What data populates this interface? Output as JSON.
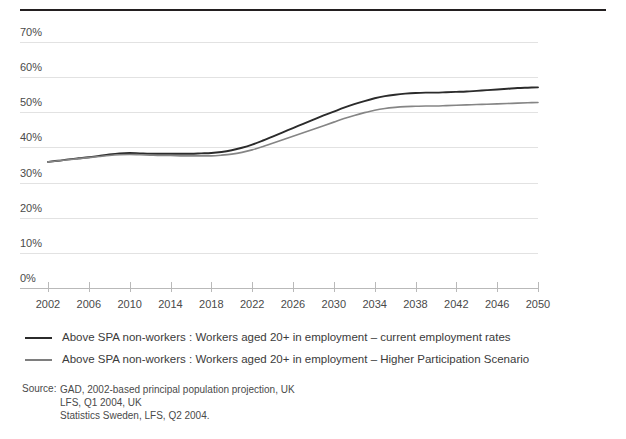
{
  "figure": {
    "title_partial": "",
    "rule_color": "#231f20"
  },
  "source": {
    "label": "Source:",
    "lines": [
      "GAD, 2002-based principal population projection, UK",
      "LFS, Q1 2004, UK",
      "Statistics Sweden, LFS, Q2 2004."
    ]
  },
  "chart_data": {
    "type": "line",
    "title": "",
    "subtitle": "",
    "xlabel": "",
    "ylabel": "",
    "xlim": [
      2002,
      2050
    ],
    "ylim": [
      0,
      70
    ],
    "grid": true,
    "legend_position": "below",
    "y_tick_labels": [
      "70%",
      "60%",
      "50%",
      "40%",
      "30%",
      "20%",
      "10%",
      "0%"
    ],
    "y_tick_values": [
      70,
      60,
      50,
      40,
      30,
      20,
      10,
      0
    ],
    "x_tick_labels": [
      "2002",
      "2006",
      "2010",
      "2014",
      "2018",
      "2022",
      "2026",
      "2030",
      "2034",
      "2038",
      "2042",
      "2046",
      "2050"
    ],
    "x_tick_values": [
      2002,
      2006,
      2010,
      2014,
      2018,
      2022,
      2026,
      2030,
      2034,
      2038,
      2042,
      2046,
      2050
    ],
    "x": [
      2002,
      2003,
      2004,
      2005,
      2006,
      2007,
      2008,
      2009,
      2010,
      2011,
      2012,
      2013,
      2014,
      2015,
      2016,
      2017,
      2018,
      2019,
      2020,
      2021,
      2022,
      2023,
      2024,
      2025,
      2026,
      2027,
      2028,
      2029,
      2030,
      2031,
      2032,
      2033,
      2034,
      2035,
      2036,
      2037,
      2038,
      2039,
      2040,
      2041,
      2042,
      2043,
      2044,
      2045,
      2046,
      2047,
      2048,
      2049,
      2050
    ],
    "series": [
      {
        "name": "Above SPA non-workers : Workers aged 20+ in employment – current employment rates",
        "color": "#2b2b2b",
        "width": 1.9,
        "values": [
          35.9,
          36.2,
          36.6,
          36.9,
          37.2,
          37.6,
          38.0,
          38.3,
          38.4,
          38.3,
          38.2,
          38.2,
          38.2,
          38.2,
          38.2,
          38.3,
          38.4,
          38.7,
          39.2,
          39.9,
          40.8,
          41.9,
          43.1,
          44.3,
          45.5,
          46.7,
          47.9,
          49.1,
          50.2,
          51.3,
          52.3,
          53.2,
          54.0,
          54.6,
          55.0,
          55.3,
          55.5,
          55.6,
          55.6,
          55.7,
          55.8,
          55.9,
          56.1,
          56.3,
          56.5,
          56.7,
          56.9,
          57.0,
          57.1
        ]
      },
      {
        "name": "Above SPA non-workers : Workers aged 20+ in employment – Higher Participation Scenario",
        "color": "#858585",
        "width": 1.6,
        "values": [
          35.9,
          36.2,
          36.5,
          36.8,
          37.1,
          37.4,
          37.7,
          37.9,
          38.0,
          37.9,
          37.8,
          37.7,
          37.7,
          37.6,
          37.6,
          37.6,
          37.6,
          37.8,
          38.1,
          38.6,
          39.3,
          40.2,
          41.2,
          42.2,
          43.2,
          44.2,
          45.2,
          46.2,
          47.2,
          48.2,
          49.1,
          49.9,
          50.6,
          51.1,
          51.4,
          51.6,
          51.7,
          51.8,
          51.8,
          51.9,
          52.0,
          52.1,
          52.2,
          52.3,
          52.4,
          52.5,
          52.6,
          52.7,
          52.8
        ]
      }
    ]
  },
  "legend": {
    "items": [
      {
        "label": "Above SPA non-workers : Workers aged 20+ in employment – current employment rates",
        "color": "#2b2b2b",
        "thickness": 2.5
      },
      {
        "label": "Above SPA non-workers : Workers aged 20+ in employment – Higher Participation Scenario",
        "color": "#7e7e7e",
        "thickness": 2
      }
    ]
  }
}
